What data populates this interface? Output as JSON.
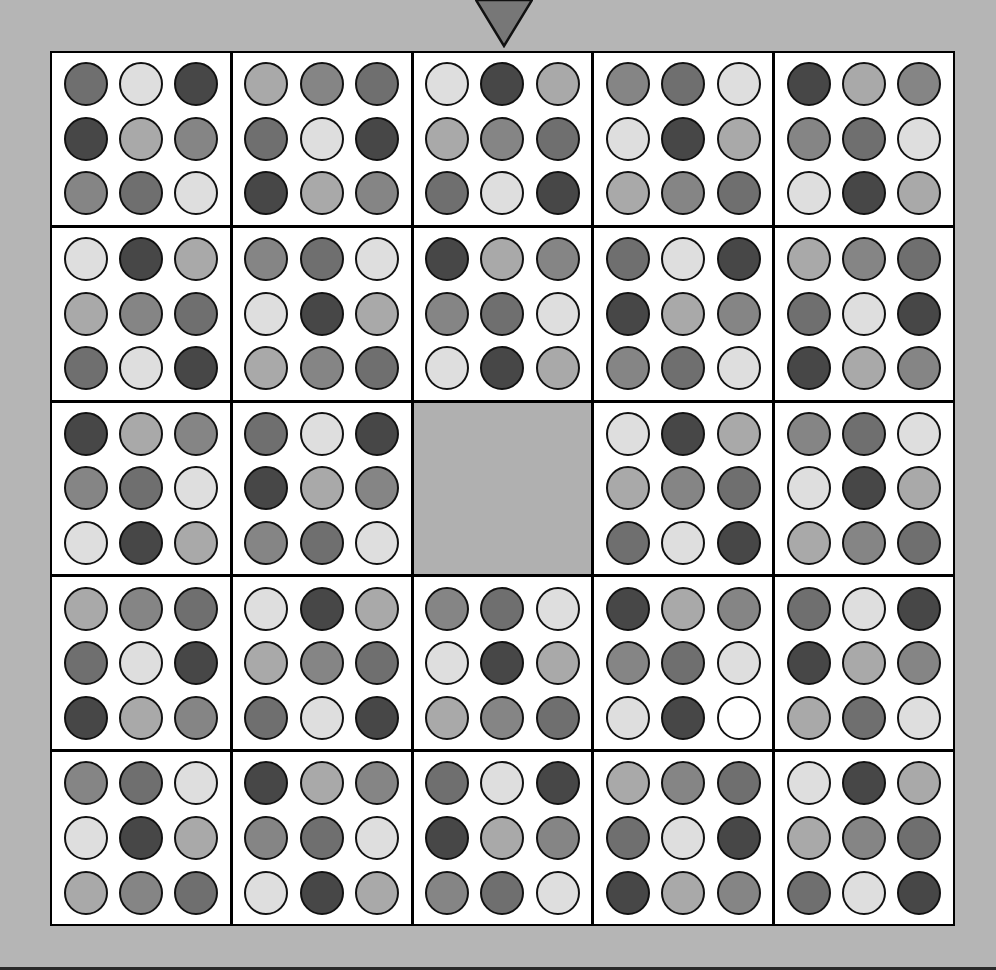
{
  "palette": {
    "D": "#474747",
    "M2": "#6f6f6f",
    "M": "#858585",
    "L2": "#a9a9a9",
    "L": "#dedede",
    "W": "#ffffff"
  },
  "colors": {
    "background": "#b5b5b5",
    "board_border": "#000000",
    "tile_bg": "#ffffff",
    "empty_slot": "#b0b0b0",
    "pointer": "#777777"
  },
  "pointer": {
    "column": 2,
    "direction": "down"
  },
  "board": {
    "rows": 5,
    "cols": 5,
    "empty_slot": [
      2,
      2
    ],
    "tiles": [
      [
        [
          [
            "M2",
            "L",
            "D"
          ],
          [
            "D",
            "L2",
            "M"
          ],
          [
            "M",
            "M2",
            "L"
          ]
        ],
        [
          [
            "L2",
            "M",
            "M2"
          ],
          [
            "M2",
            "L",
            "D"
          ],
          [
            "D",
            "L2",
            "M"
          ]
        ],
        [
          [
            "L",
            "D",
            "L2"
          ],
          [
            "L2",
            "M",
            "M2"
          ],
          [
            "M2",
            "L",
            "D"
          ]
        ],
        [
          [
            "M",
            "M2",
            "L"
          ],
          [
            "L",
            "D",
            "L2"
          ],
          [
            "L2",
            "M",
            "M2"
          ]
        ],
        [
          [
            "D",
            "L2",
            "M"
          ],
          [
            "M",
            "M2",
            "L"
          ],
          [
            "L",
            "D",
            "L2"
          ]
        ]
      ],
      [
        [
          [
            "L",
            "D",
            "L2"
          ],
          [
            "L2",
            "M",
            "M2"
          ],
          [
            "M2",
            "L",
            "D"
          ]
        ],
        [
          [
            "M",
            "M2",
            "L"
          ],
          [
            "L",
            "D",
            "L2"
          ],
          [
            "L2",
            "M",
            "M2"
          ]
        ],
        [
          [
            "D",
            "L2",
            "M"
          ],
          [
            "M",
            "M2",
            "L"
          ],
          [
            "L",
            "D",
            "L2"
          ]
        ],
        [
          [
            "M2",
            "L",
            "D"
          ],
          [
            "D",
            "L2",
            "M"
          ],
          [
            "M",
            "M2",
            "L"
          ]
        ],
        [
          [
            "L2",
            "M",
            "M2"
          ],
          [
            "M2",
            "L",
            "D"
          ],
          [
            "D",
            "L2",
            "M"
          ]
        ]
      ],
      [
        [
          [
            "D",
            "L2",
            "M"
          ],
          [
            "M",
            "M2",
            "L"
          ],
          [
            "L",
            "D",
            "L2"
          ]
        ],
        [
          [
            "M2",
            "L",
            "D"
          ],
          [
            "D",
            "L2",
            "M"
          ],
          [
            "M",
            "M2",
            "L"
          ]
        ],
        null,
        [
          [
            "L",
            "D",
            "L2"
          ],
          [
            "L2",
            "M",
            "M2"
          ],
          [
            "M2",
            "L",
            "D"
          ]
        ],
        [
          [
            "M",
            "M2",
            "L"
          ],
          [
            "L",
            "D",
            "L2"
          ],
          [
            "L2",
            "M",
            "M2"
          ]
        ]
      ],
      [
        [
          [
            "L2",
            "M",
            "M2"
          ],
          [
            "M2",
            "L",
            "D"
          ],
          [
            "D",
            "L2",
            "M"
          ]
        ],
        [
          [
            "L",
            "D",
            "L2"
          ],
          [
            "L2",
            "M",
            "M2"
          ],
          [
            "M2",
            "L",
            "D"
          ]
        ],
        [
          [
            "M",
            "M2",
            "L"
          ],
          [
            "L",
            "D",
            "L2"
          ],
          [
            "L2",
            "M",
            "M2"
          ]
        ],
        [
          [
            "D",
            "L2",
            "M"
          ],
          [
            "M",
            "M2",
            "L"
          ],
          [
            "L",
            "D",
            "W"
          ]
        ],
        [
          [
            "M2",
            "L",
            "D"
          ],
          [
            "D",
            "L2",
            "M"
          ],
          [
            "L2",
            "M2",
            "L"
          ]
        ]
      ],
      [
        [
          [
            "M",
            "M2",
            "L"
          ],
          [
            "L",
            "D",
            "L2"
          ],
          [
            "L2",
            "M",
            "M2"
          ]
        ],
        [
          [
            "D",
            "L2",
            "M"
          ],
          [
            "M",
            "M2",
            "L"
          ],
          [
            "L",
            "D",
            "L2"
          ]
        ],
        [
          [
            "M2",
            "L",
            "D"
          ],
          [
            "D",
            "L2",
            "M"
          ],
          [
            "M",
            "M2",
            "L"
          ]
        ],
        [
          [
            "L2",
            "M",
            "M2"
          ],
          [
            "M2",
            "L",
            "D"
          ],
          [
            "D",
            "L2",
            "M"
          ]
        ],
        [
          [
            "L",
            "D",
            "L2"
          ],
          [
            "L2",
            "M",
            "M2"
          ],
          [
            "M2",
            "L",
            "D"
          ]
        ]
      ]
    ]
  }
}
